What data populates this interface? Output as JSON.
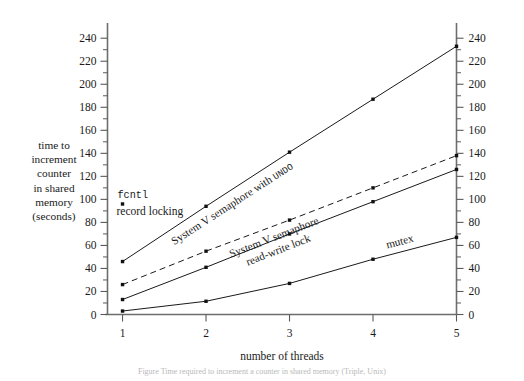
{
  "chart_data": {
    "type": "line",
    "title": "",
    "xlabel": "number of threads",
    "ylabel": "time to increment counter in shared memory (seconds)",
    "ylabel_lines": [
      "time to",
      "increment",
      "counter",
      "in shared",
      "memory",
      "(seconds)"
    ],
    "x": [
      1,
      2,
      3,
      4,
      5
    ],
    "xlim": [
      0.82,
      5.0
    ],
    "ylim": [
      0,
      248
    ],
    "xticks": [
      "1",
      "2",
      "3",
      "4",
      "5"
    ],
    "yticks": [
      "0",
      "20",
      "40",
      "60",
      "80",
      "100",
      "120",
      "140",
      "160",
      "180",
      "200",
      "220",
      "240"
    ],
    "ytick_values": [
      0,
      20,
      40,
      60,
      80,
      100,
      120,
      140,
      160,
      180,
      200,
      220,
      240
    ],
    "ytick_minor_step": 10,
    "grid": false,
    "legend": "inline-labels",
    "axes": [
      "left",
      "right",
      "bottom"
    ],
    "series": [
      {
        "name": "System V semaphore with UNDO",
        "label_plain": "System V semaphore with ",
        "label_smallcaps": "UNDO",
        "style": "solid",
        "values": [
          46,
          94,
          141,
          187,
          233
        ]
      },
      {
        "name": "System V semaphore",
        "label_plain": "System V semaphore",
        "label_smallcaps": "",
        "style": "dashed",
        "values": [
          26,
          55,
          82,
          110,
          138
        ]
      },
      {
        "name": "read-write lock",
        "label_plain": "read-write lock",
        "label_smallcaps": "",
        "style": "solid",
        "values": [
          13,
          41,
          70,
          98,
          126
        ]
      },
      {
        "name": "mutex",
        "label_plain": "mutex",
        "label_smallcaps": "",
        "style": "solid",
        "values": [
          3,
          11.5,
          27,
          48,
          67
        ]
      }
    ],
    "annotations": [
      {
        "name": "fcntl-record-locking",
        "mono_text": "fcntl",
        "serif_text": "record locking",
        "note": "top curve datapoint at x=1 is 96 (fcntl record locking, series continues off chart)",
        "point_value": 96
      }
    ],
    "colors": {
      "line": "#1a1a1a",
      "axis": "#6e6e6e",
      "marker": "#111111",
      "background": "#ffffff",
      "caption": "#b9b9b9"
    }
  },
  "caption": {
    "text": "Figure  Time required to increment a counter in shared memory  (Triple, Unix)"
  }
}
